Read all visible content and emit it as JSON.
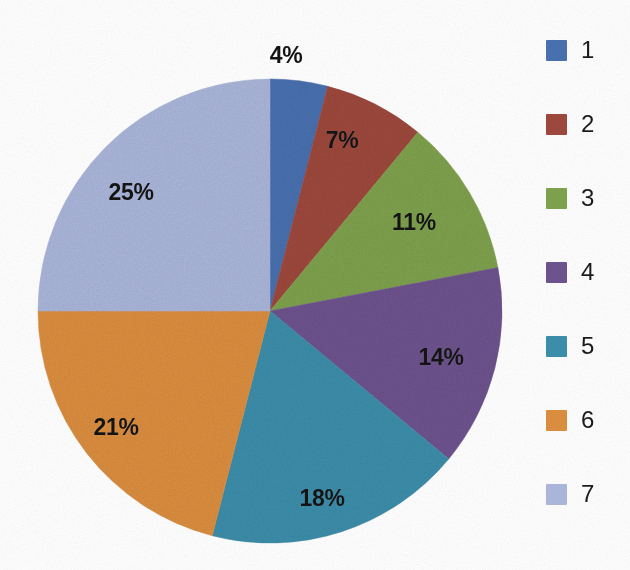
{
  "chart_data": {
    "type": "pie",
    "title": "",
    "subtitle": "",
    "xlabel": "",
    "ylabel": "",
    "grid": false,
    "legend_position": "right",
    "start_angle_deg": 0,
    "direction": "clockwise",
    "categories": [
      "1",
      "2",
      "3",
      "4",
      "5",
      "6",
      "7"
    ],
    "values": [
      4,
      7,
      11,
      14,
      18,
      21,
      25
    ],
    "value_unit": "%",
    "data_labels": [
      "4%",
      "7%",
      "11%",
      "14%",
      "18%",
      "21%",
      "25%"
    ],
    "colors": [
      "#4a72b2",
      "#a0493d",
      "#80a44e",
      "#6f5490",
      "#3d90ad",
      "#df9040",
      "#adb9de"
    ],
    "legend_entries": [
      {
        "label": "1",
        "color": "#4a72b2",
        "value": 4
      },
      {
        "label": "2",
        "color": "#a0493d",
        "value": 7
      },
      {
        "label": "3",
        "color": "#80a44e",
        "value": 11
      },
      {
        "label": "4",
        "color": "#6f5490",
        "value": 14
      },
      {
        "label": "5",
        "color": "#3d90ad",
        "value": 18
      },
      {
        "label": "6",
        "color": "#df9040",
        "value": 21
      },
      {
        "label": "7",
        "color": "#adb9de",
        "value": 25
      }
    ]
  },
  "geometry": {
    "center_x": 270,
    "center_y": 311,
    "radius": 232
  },
  "labels": [
    {
      "text": "4%",
      "x": 286,
      "y": 55
    },
    {
      "text": "7%",
      "x": 342,
      "y": 140
    },
    {
      "text": "11%",
      "x": 414,
      "y": 222
    },
    {
      "text": "14%",
      "x": 441,
      "y": 357
    },
    {
      "text": "18%",
      "x": 322,
      "y": 498
    },
    {
      "text": "21%",
      "x": 116,
      "y": 427
    },
    {
      "text": "25%",
      "x": 131,
      "y": 192
    }
  ],
  "legend": {
    "items": [
      {
        "label": "1",
        "color": "#4a72b2",
        "y": 0
      },
      {
        "label": "2",
        "color": "#a0493d",
        "y": 74
      },
      {
        "label": "3",
        "color": "#80a44e",
        "y": 148
      },
      {
        "label": "4",
        "color": "#6f5490",
        "y": 222
      },
      {
        "label": "5",
        "color": "#3d90ad",
        "y": 296
      },
      {
        "label": "6",
        "color": "#df9040",
        "y": 370
      },
      {
        "label": "7",
        "color": "#adb9de",
        "y": 444
      }
    ]
  }
}
